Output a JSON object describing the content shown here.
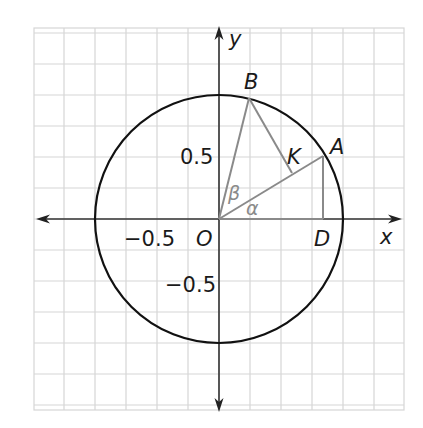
{
  "figure": {
    "grid": {
      "x0": 34,
      "y0": 28,
      "x1": 404,
      "y1": 410,
      "step": 31
    },
    "origin": {
      "px": 219,
      "py": 219
    },
    "unit_px": 124,
    "axis_labels": {
      "x": "x",
      "y": "y"
    },
    "tick_labels": {
      "x_neg": "−0.5",
      "y_pos": "0.5",
      "y_neg": "−0.5"
    },
    "points": {
      "O": {
        "label": "O",
        "coord": [
          0,
          0
        ]
      },
      "A": {
        "label": "A",
        "coord": [
          0.84,
          0.5
        ]
      },
      "B": {
        "label": "B",
        "coord": [
          0.25,
          0.97
        ]
      },
      "D": {
        "label": "D",
        "coord": [
          0.84,
          0
        ]
      },
      "K": {
        "label": "K",
        "coord": [
          0.59,
          0.36
        ]
      }
    },
    "angles": {
      "alpha": "α",
      "beta": "β"
    },
    "colors": {
      "circle": "#111111",
      "axes": "#333333",
      "segments": "#8a8a8a",
      "grid": "#d6d6d6",
      "text": "#1a1a1a",
      "angle_text": "#8a8a8a"
    }
  }
}
